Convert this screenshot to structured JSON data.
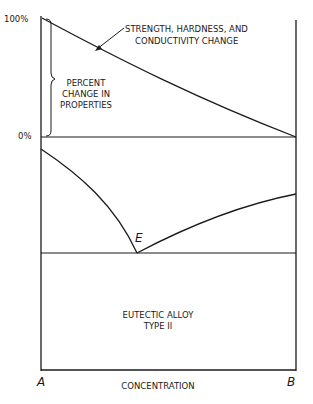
{
  "diagram": {
    "y_axis_top_label": "100%",
    "y_axis_zero_label": "0%",
    "curve_annotation_line1": "STRENGTH, HARDNESS, AND",
    "curve_annotation_line2": "CONDUCTIVITY CHANGE",
    "bracket_label_line1": "PERCENT",
    "bracket_label_line2": "CHANGE IN",
    "bracket_label_line3": "PROPERTIES",
    "eutectic_point_label": "E",
    "region_label_line1": "EUTECTIC ALLOY",
    "region_label_line2": "TYPE II",
    "x_axis_left_label": "A",
    "x_axis_right_label": "B",
    "x_axis_title": "CONCENTRATION"
  },
  "colors": {
    "line": "#1a1a1a",
    "background": "#ffffff"
  }
}
